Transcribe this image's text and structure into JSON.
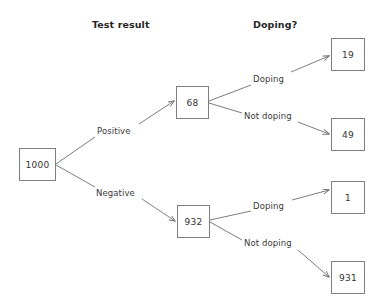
{
  "diagram": {
    "type": "decision-tree",
    "headers": [
      {
        "id": "test-result",
        "label": "Test result",
        "x": 92,
        "y": 19
      },
      {
        "id": "doping",
        "label": "Doping?",
        "x": 253,
        "y": 19
      }
    ],
    "nodes": [
      {
        "id": "root",
        "value": "1000",
        "x": 19,
        "y": 148,
        "w": 37,
        "h": 33
      },
      {
        "id": "positive",
        "value": "68",
        "x": 176,
        "y": 86,
        "w": 33,
        "h": 33
      },
      {
        "id": "negative",
        "value": "932",
        "x": 177,
        "y": 205,
        "w": 33,
        "h": 33
      },
      {
        "id": "pos-doping",
        "value": "19",
        "x": 331,
        "y": 38,
        "w": 34,
        "h": 33
      },
      {
        "id": "pos-clean",
        "value": "49",
        "x": 331,
        "y": 118,
        "w": 34,
        "h": 33
      },
      {
        "id": "neg-doping",
        "value": "1",
        "x": 331,
        "y": 181,
        "w": 34,
        "h": 33
      },
      {
        "id": "neg-clean",
        "value": "931",
        "x": 331,
        "y": 261,
        "w": 34,
        "h": 33
      }
    ],
    "edges": [
      {
        "id": "root-positive",
        "label": "Positive",
        "label_x": 97,
        "label_y": 126,
        "from": "root",
        "to": "positive"
      },
      {
        "id": "root-negative",
        "label": "Negative",
        "label_x": 96,
        "label_y": 188,
        "from": "root",
        "to": "negative"
      },
      {
        "id": "positive-doping",
        "label": "Doping",
        "label_x": 253,
        "label_y": 74,
        "from": "positive",
        "to": "pos-doping"
      },
      {
        "id": "positive-not-doping",
        "label": "Not doping",
        "label_x": 244,
        "label_y": 111,
        "from": "positive",
        "to": "pos-clean"
      },
      {
        "id": "negative-doping",
        "label": "Doping",
        "label_x": 253,
        "label_y": 201,
        "from": "negative",
        "to": "neg-doping"
      },
      {
        "id": "negative-not-doping",
        "label": "Not doping",
        "label_x": 244,
        "label_y": 238,
        "from": "negative",
        "to": "neg-clean"
      }
    ],
    "colors": {
      "box_border": "#7f7f7f",
      "line": "#6e6e6e",
      "text": "#333333",
      "header_text": "#262626",
      "background": "#ffffff"
    }
  }
}
